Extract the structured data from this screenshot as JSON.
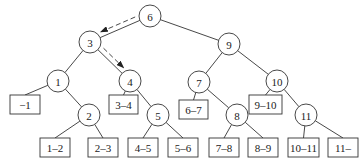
{
  "diagram": {
    "type": "binary-search-tree-with-interval-leaves",
    "nodes": [
      {
        "id": "n6",
        "label": "6",
        "x": 150,
        "y": 16
      },
      {
        "id": "n3",
        "label": "3",
        "x": 90,
        "y": 42
      },
      {
        "id": "n9",
        "label": "9",
        "x": 229,
        "y": 44
      },
      {
        "id": "n1",
        "label": "1",
        "x": 58,
        "y": 81
      },
      {
        "id": "n4",
        "label": "4",
        "x": 130,
        "y": 81
      },
      {
        "id": "n7",
        "label": "7",
        "x": 199,
        "y": 82
      },
      {
        "id": "n10",
        "label": "10",
        "x": 277,
        "y": 81
      },
      {
        "id": "n2",
        "label": "2",
        "x": 89,
        "y": 115
      },
      {
        "id": "n5",
        "label": "5",
        "x": 158,
        "y": 115
      },
      {
        "id": "n8",
        "label": "8",
        "x": 237,
        "y": 115
      },
      {
        "id": "n11",
        "label": "11",
        "x": 306,
        "y": 115
      }
    ],
    "leaves": [
      {
        "id": "l_m1",
        "label": "−1",
        "x": 10,
        "y": 95,
        "w": 30,
        "h": 19
      },
      {
        "id": "l_34",
        "label": "3–4",
        "x": 109,
        "y": 95,
        "w": 29,
        "h": 19
      },
      {
        "id": "l_67",
        "label": "6–7",
        "x": 179,
        "y": 100,
        "w": 29,
        "h": 19
      },
      {
        "id": "l_910",
        "label": "9–10",
        "x": 249,
        "y": 95,
        "w": 33,
        "h": 19
      },
      {
        "id": "l_12",
        "label": "1–2",
        "x": 40,
        "y": 138,
        "w": 30,
        "h": 19
      },
      {
        "id": "l_23",
        "label": "2–3",
        "x": 88,
        "y": 138,
        "w": 30,
        "h": 19
      },
      {
        "id": "l_45",
        "label": "4–5",
        "x": 128,
        "y": 138,
        "w": 30,
        "h": 19
      },
      {
        "id": "l_56",
        "label": "5–6",
        "x": 168,
        "y": 138,
        "w": 30,
        "h": 19
      },
      {
        "id": "l_78",
        "label": "7–8",
        "x": 209,
        "y": 138,
        "w": 30,
        "h": 19
      },
      {
        "id": "l_89",
        "label": "8–9",
        "x": 248,
        "y": 138,
        "w": 30,
        "h": 19
      },
      {
        "id": "l_1011",
        "label": "10–11",
        "x": 288,
        "y": 138,
        "w": 31,
        "h": 19
      },
      {
        "id": "l_11",
        "label": "11–",
        "x": 328,
        "y": 138,
        "w": 30,
        "h": 19
      }
    ],
    "edges": [
      [
        "n6",
        "n3"
      ],
      [
        "n6",
        "n9"
      ],
      [
        "n3",
        "n1"
      ],
      [
        "n3",
        "n4"
      ],
      [
        "n9",
        "n7"
      ],
      [
        "n9",
        "n10"
      ],
      [
        "n1",
        "l_m1"
      ],
      [
        "n1",
        "n2"
      ],
      [
        "n4",
        "l_34"
      ],
      [
        "n4",
        "n5"
      ],
      [
        "n7",
        "l_67"
      ],
      [
        "n7",
        "n8"
      ],
      [
        "n10",
        "l_910"
      ],
      [
        "n10",
        "n11"
      ],
      [
        "n2",
        "l_12"
      ],
      [
        "n2",
        "l_23"
      ],
      [
        "n5",
        "l_45"
      ],
      [
        "n5",
        "l_56"
      ],
      [
        "n8",
        "l_78"
      ],
      [
        "n8",
        "l_89"
      ],
      [
        "n11",
        "l_1011"
      ],
      [
        "n11",
        "l_11"
      ]
    ],
    "search_path_arrows": [
      {
        "from": "n6",
        "to": "n3",
        "style": "dashed"
      },
      {
        "from": "n3",
        "to": "n4",
        "style": "dashed"
      }
    ],
    "node_radius": 11
  }
}
